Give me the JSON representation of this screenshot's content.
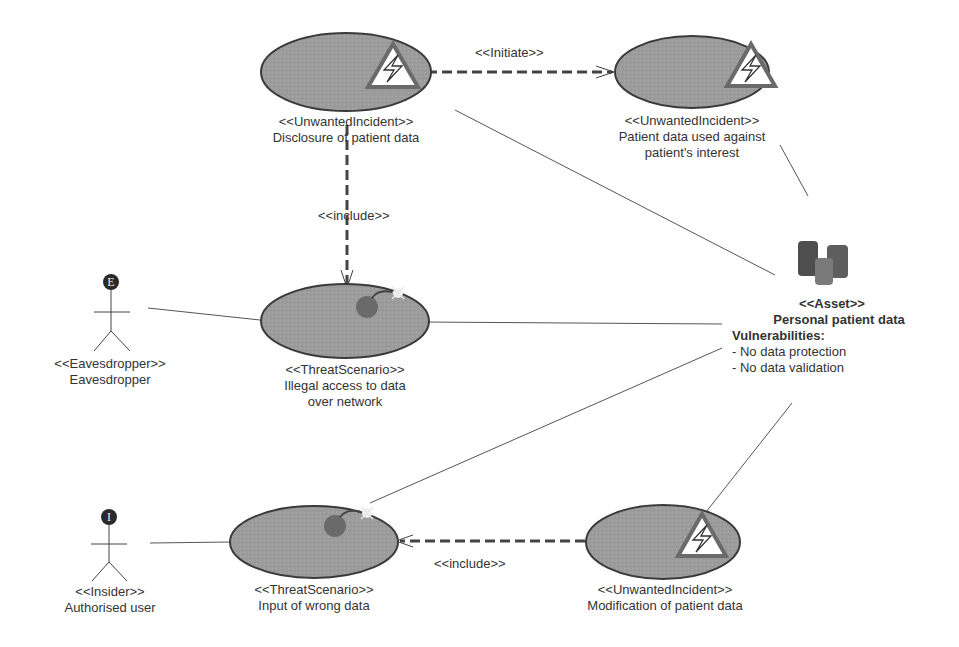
{
  "diagram": {
    "nodes": {
      "disclosure": {
        "stereotype": "<<UnwantedIncident>>",
        "name": "Disclosure of patient data"
      },
      "used_against": {
        "stereotype": "<<UnwantedIncident>>",
        "name_line1": "Patient data used against",
        "name_line2": "patient's interest"
      },
      "illegal_access": {
        "stereotype": "<<ThreatScenario>>",
        "name_line1": "Illegal access to data",
        "name_line2": "over network"
      },
      "input_wrong": {
        "stereotype": "<<ThreatScenario>>",
        "name": "Input of wrong data"
      },
      "modification": {
        "stereotype": "<<UnwantedIncident>>",
        "name": "Modification of patient data"
      },
      "eavesdropper": {
        "stereotype": "<<Eavesdropper>>",
        "name": "Eavesdropper",
        "badge": "E"
      },
      "insider": {
        "stereotype": "<<Insider>>",
        "name": "Authorised user",
        "badge": "I"
      },
      "asset": {
        "stereotype": "<<Asset>>",
        "name": "Personal patient data",
        "vuln_title": "Vulnerabilities:",
        "vulnerabilities": [
          "- No data protection",
          "- No data validation"
        ]
      }
    },
    "edges": {
      "initiate": "<<Initiate>>",
      "include_top": "<<include>>",
      "include_bottom": "<<include>>"
    }
  }
}
